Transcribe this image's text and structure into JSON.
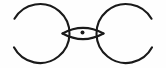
{
  "figure": {
    "canvas": {
      "width": 166,
      "height": 68,
      "background": "#fefefe"
    },
    "style": {
      "stroke_color": "#1a1a1a",
      "stroke_width": 2.1,
      "fill": "none",
      "line_cap": "round"
    },
    "elements": [
      {
        "name": "left-circle",
        "type": "circle-arc",
        "center_x": 40,
        "center_y": 33.5,
        "radius": 29.5,
        "gap_start_deg": 152,
        "gap_end_deg": 210,
        "note": "open arc; gap faces the left image edge"
      },
      {
        "name": "right-circle",
        "type": "circle-arc",
        "center_x": 126,
        "center_y": 33.5,
        "radius": 29.5,
        "gap_start_deg": -30,
        "gap_end_deg": 28,
        "note": "open arc; gap faces the right image edge"
      },
      {
        "name": "lens-upper-arc",
        "type": "arc",
        "from_x": 62.5,
        "from_y": 33.5,
        "to_x": 103.5,
        "to_y": 33.5,
        "sweep_height": -7.5
      },
      {
        "name": "lens-lower-arc",
        "type": "arc",
        "from_x": 62.5,
        "from_y": 33.5,
        "to_x": 103.5,
        "to_y": 33.5,
        "sweep_height": 7.5
      },
      {
        "name": "center-dot",
        "type": "filled-circle",
        "center_x": 82.5,
        "center_y": 32.6,
        "radius": 2.0,
        "color": "#1a1a1a"
      },
      {
        "name": "left-crossing-point",
        "type": "intersection",
        "x": 62.5,
        "y": 33.5
      },
      {
        "name": "right-crossing-point",
        "type": "intersection",
        "x": 103.5,
        "y": 33.5
      }
    ]
  }
}
